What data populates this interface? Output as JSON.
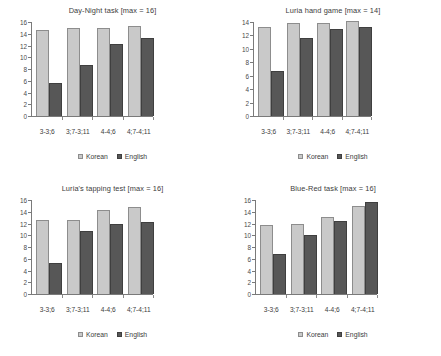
{
  "figure": {
    "background": "#ffffff",
    "series_colors": {
      "Korean": "#c9c9c9",
      "English": "#575757"
    },
    "legend_labels": {
      "korean": "Korean",
      "english": "English"
    }
  },
  "chart_data": [
    {
      "type": "bar",
      "title": "Day-Night task [max = 16]",
      "xlabel": "",
      "ylabel": "",
      "ylim": [
        0,
        16
      ],
      "yticks": [
        0,
        2,
        4,
        6,
        8,
        10,
        12,
        14,
        16
      ],
      "grid": false,
      "legend_position": "bottom",
      "categories": [
        "3-3;6",
        "3;7-3;11",
        "4-4;6",
        "4;7-4;11"
      ],
      "series": [
        {
          "name": "Korean",
          "values": [
            14.7,
            15.0,
            15.0,
            15.4
          ]
        },
        {
          "name": "English",
          "values": [
            5.6,
            8.7,
            12.2,
            13.2
          ]
        }
      ]
    },
    {
      "type": "bar",
      "title": "Luria hand game [max = 14]",
      "xlabel": "",
      "ylabel": "",
      "ylim": [
        0,
        14
      ],
      "yticks": [
        0,
        2,
        4,
        6,
        8,
        10,
        12,
        14
      ],
      "grid": false,
      "legend_position": "bottom",
      "categories": [
        "3-3;6",
        "3;7-3;11",
        "4-4;6",
        "4;7-4;11"
      ],
      "series": [
        {
          "name": "Korean",
          "values": [
            13.3,
            13.9,
            13.9,
            14.1
          ]
        },
        {
          "name": "English",
          "values": [
            6.7,
            11.6,
            12.9,
            13.2
          ]
        }
      ]
    },
    {
      "type": "bar",
      "title": "Luria's tapping test [max = 16]",
      "xlabel": "",
      "ylabel": "",
      "ylim": [
        0,
        16
      ],
      "yticks": [
        0,
        2,
        4,
        6,
        8,
        10,
        12,
        14,
        16
      ],
      "grid": false,
      "legend_position": "bottom",
      "categories": [
        "3-3;6",
        "3;7-3;11",
        "4-4;6",
        "4;7-4;11"
      ],
      "series": [
        {
          "name": "Korean",
          "values": [
            12.6,
            12.6,
            14.3,
            14.8
          ]
        },
        {
          "name": "English",
          "values": [
            5.3,
            10.8,
            11.9,
            12.2
          ]
        }
      ]
    },
    {
      "type": "bar",
      "title": "Blue-Red task [max = 16]",
      "xlabel": "",
      "ylabel": "",
      "ylim": [
        0,
        16
      ],
      "yticks": [
        0,
        2,
        4,
        6,
        8,
        10,
        12,
        14,
        16
      ],
      "grid": false,
      "legend_position": "bottom",
      "categories": [
        "3-3;6",
        "3;7-3;11",
        "4-4;6",
        "4;7-4;11"
      ],
      "series": [
        {
          "name": "Korean",
          "values": [
            11.7,
            11.9,
            13.1,
            14.9
          ]
        },
        {
          "name": "English",
          "values": [
            6.8,
            10.1,
            12.4,
            15.6
          ]
        }
      ]
    }
  ]
}
